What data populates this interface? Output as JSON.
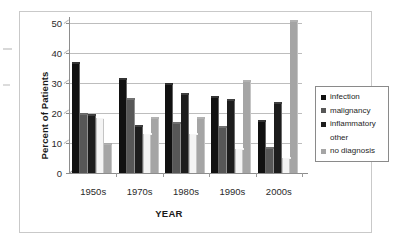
{
  "chart_data": {
    "type": "bar",
    "title": "",
    "subtitle": "",
    "xlabel": "YEAR",
    "ylabel": "Percent of Patients",
    "categories": [
      "1950s",
      "1970s",
      "1980s",
      "1990s",
      "2000s"
    ],
    "ylim": [
      0,
      50
    ],
    "yticks": [
      0,
      10,
      20,
      30,
      40,
      50
    ],
    "ytick_labels": [
      "0",
      "10",
      "20",
      "30",
      "40",
      "50"
    ],
    "grid": true,
    "legend_position": "right",
    "series": [
      {
        "name": "infection",
        "color": "#111111",
        "values": [
          36.5,
          31.0,
          29.5,
          25.0,
          17.0
        ]
      },
      {
        "name": "malignancy",
        "color": "#575757",
        "values": [
          19.5,
          24.5,
          16.5,
          15.0,
          8.0
        ]
      },
      {
        "name": "inflammatory",
        "color": "#1d1d1d",
        "values": [
          19.0,
          15.5,
          26.0,
          24.0,
          23.0
        ]
      },
      {
        "name": "other",
        "color": "#f4f4f4",
        "values": [
          18.5,
          13.0,
          13.0,
          8.0,
          5.0
        ]
      },
      {
        "name": "no diagnosis",
        "color": "#a5a5a5",
        "values": [
          9.5,
          18.0,
          18.0,
          30.5,
          50.5
        ]
      }
    ]
  },
  "legend": {
    "items": [
      {
        "label": "infection",
        "swatch": "#111111"
      },
      {
        "label": "malignancy",
        "swatch": "#575757"
      },
      {
        "label": "inflammatory",
        "swatch": "#1d1d1d"
      },
      {
        "label": "other",
        "swatch": "#ffffff"
      },
      {
        "label": "no diagnosis",
        "swatch": "#a5a5a5"
      }
    ]
  },
  "axes": {
    "y_title": "Percent of Patients",
    "x_title": "YEAR"
  }
}
